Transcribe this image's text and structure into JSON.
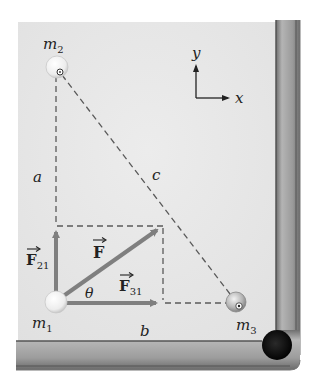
{
  "figure": {
    "colors": {
      "table_felt": "#e6e6e6",
      "rail": "#9a9a9a",
      "rail_dark": "#6b6b6b",
      "pocket": "#111111",
      "vector": "#7f7f7f",
      "dashed": "#555555",
      "text": "#222222"
    },
    "masses": [
      {
        "id": "m1",
        "label_base": "m",
        "label_sub": "1",
        "role": "ball at lower-left corner of right triangle"
      },
      {
        "id": "m2",
        "label_base": "m",
        "label_sub": "2",
        "role": "ball at top, directly above m1"
      },
      {
        "id": "m3",
        "label_base": "m",
        "label_sub": "3",
        "role": "ball at right, directly right of m1"
      }
    ],
    "distances": {
      "a": "a",
      "b": "b",
      "c": "c"
    },
    "vectors": {
      "F": {
        "base": "F",
        "sub": ""
      },
      "F21": {
        "base": "F",
        "sub": "21"
      },
      "F31": {
        "base": "F",
        "sub": "31"
      }
    },
    "angle_label": "θ",
    "axes": {
      "x_label": "x",
      "y_label": "y"
    }
  }
}
